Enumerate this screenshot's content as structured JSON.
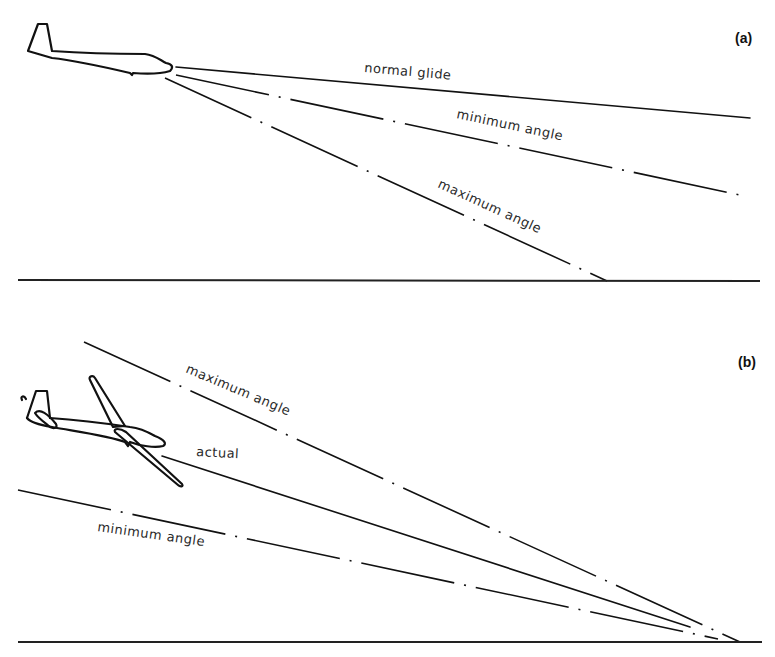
{
  "panels": [
    {
      "id": "a",
      "label": "(a)",
      "lines": [
        {
          "name": "normal glide",
          "label": "normal glide",
          "style": "solid"
        },
        {
          "name": "minimum angle",
          "label": "minimum angle",
          "style": "dash-dot"
        },
        {
          "name": "maximum angle",
          "label": "maximum angle",
          "style": "dash-dot"
        }
      ]
    },
    {
      "id": "b",
      "label": "(b)",
      "lines": [
        {
          "name": "maximum angle",
          "label": "maximum angle",
          "style": "dash-dot"
        },
        {
          "name": "actual",
          "label": "actual",
          "style": "solid"
        },
        {
          "name": "minimum angle",
          "label": "minimum angle",
          "style": "dash-dot"
        }
      ]
    }
  ],
  "colors": {
    "line": "#111111",
    "background": "#ffffff"
  }
}
